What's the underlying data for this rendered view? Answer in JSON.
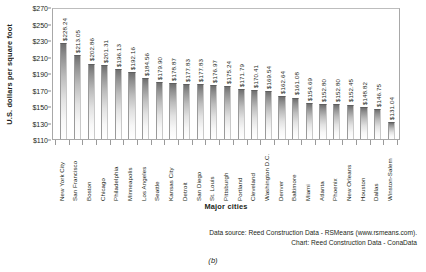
{
  "chart_data": {
    "type": "bar",
    "title": "",
    "xlabel": "Major cities",
    "ylabel": "U.S. dollars per square foot",
    "ylim": [
      110,
      270
    ],
    "ytick_step": 20,
    "ytick_labels": [
      "$270",
      "$250",
      "$230",
      "$210",
      "$190",
      "$170",
      "$150",
      "$130",
      "$110"
    ],
    "ytick_values": [
      270,
      250,
      230,
      210,
      190,
      170,
      150,
      130,
      110
    ],
    "grid": false,
    "legend": "none",
    "value_labels_rotated": true,
    "categories": [
      "New York City",
      "San Francisco",
      "Boston",
      "Chicago",
      "Philadelphia",
      "Minneapolis",
      "Los Angeles",
      "Seattle",
      "Kansas City",
      "Detroit",
      "San Diego",
      "St. Louis",
      "Pittsburgh",
      "Portland",
      "Cleveland",
      "Washington D.C.",
      "Denver",
      "Baltimore",
      "Miami",
      "Atlanta",
      "Phoenix",
      "New Orleans",
      "Houston",
      "Dallas",
      "Winston-Salem"
    ],
    "values": [
      228.24,
      213.05,
      202.86,
      201.31,
      196.13,
      192.16,
      184.56,
      179.9,
      178.87,
      177.83,
      177.83,
      176.97,
      175.24,
      171.79,
      170.41,
      169.54,
      162.64,
      161.08,
      154.69,
      152.8,
      152.8,
      152.45,
      148.82,
      146.75,
      131.04
    ],
    "value_labels": [
      "$228.24",
      "$213.05",
      "$202.86",
      "$201.31",
      "$196.13",
      "$192.16",
      "$184.56",
      "$179.90",
      "$178.87",
      "$177.83",
      "$177.83",
      "$176.97",
      "$175.24",
      "$171.79",
      "$170.41",
      "$169.54",
      "$162.64",
      "$161.08",
      "$154.69",
      "$152.80",
      "$152.80",
      "$152.45",
      "$148.82",
      "$146.75",
      "$131.04"
    ]
  },
  "footer": {
    "line1": "Data source: Reed Construction Data - RSMeans (www.rsmeans.com).",
    "line2": "Chart: Reed Construction Data - ConaData"
  },
  "caption": "(b)"
}
